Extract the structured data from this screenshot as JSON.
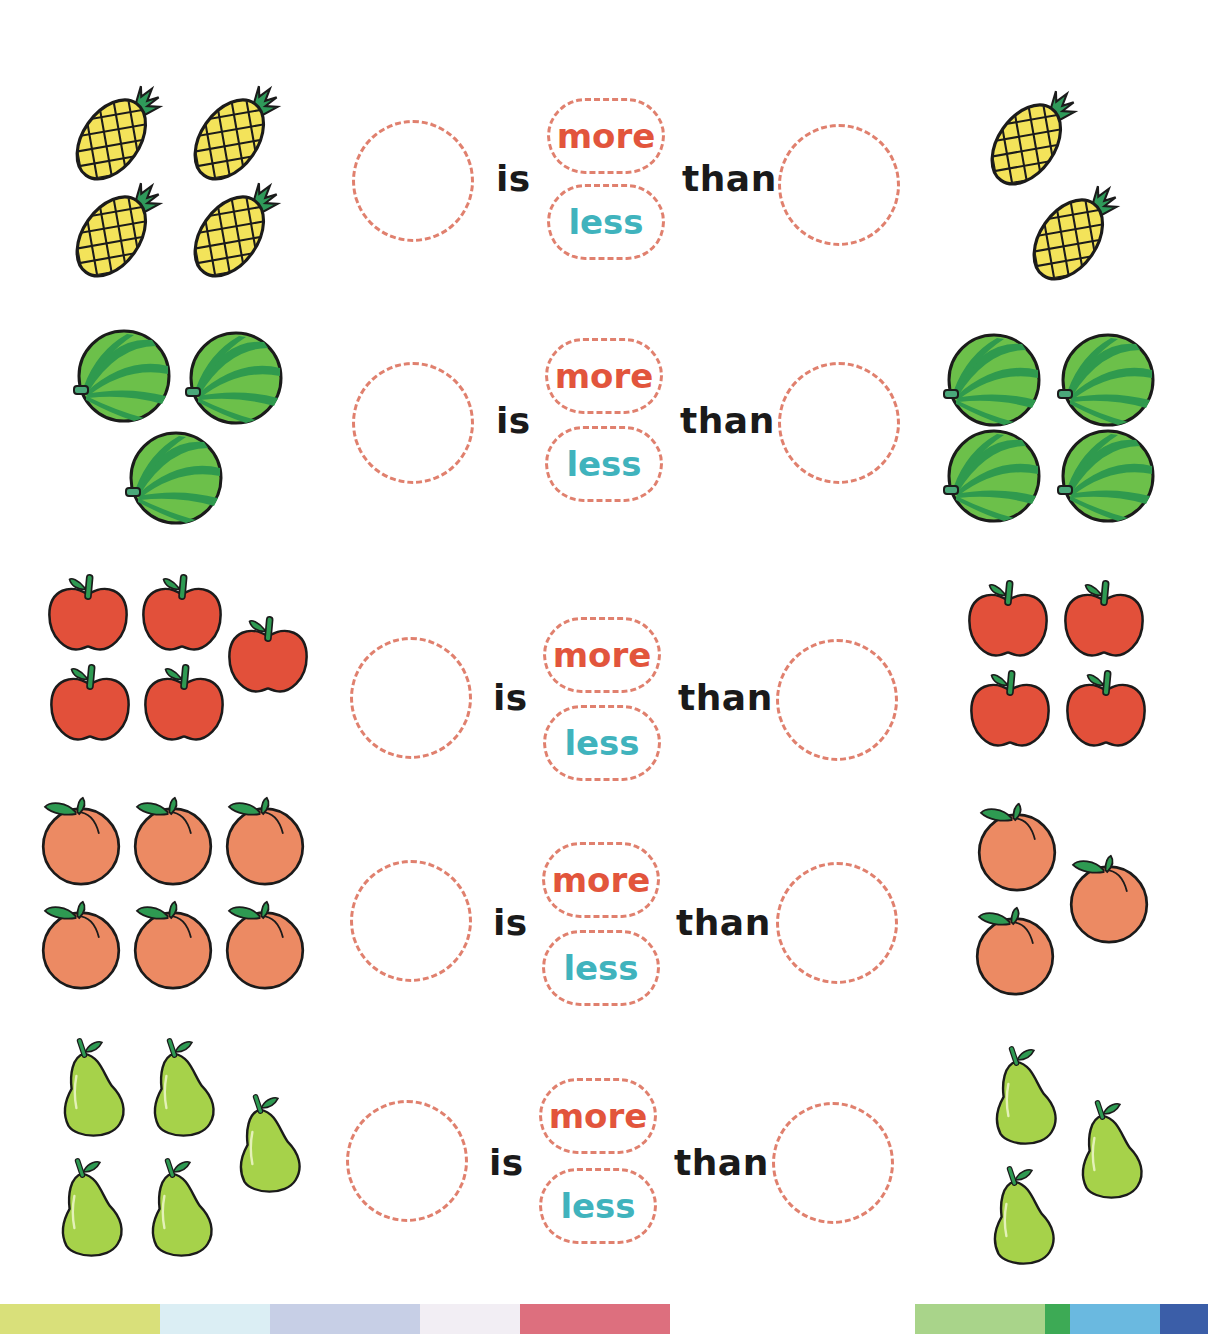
{
  "worksheet": {
    "rows": [
      {
        "fruit": "pineapple",
        "left_count": 4,
        "right_count": 2,
        "word_is": "is",
        "option_more": "more",
        "option_less": "less",
        "word_than": "than"
      },
      {
        "fruit": "watermelon",
        "left_count": 3,
        "right_count": 4,
        "word_is": "is",
        "option_more": "more",
        "option_less": "less",
        "word_than": "than"
      },
      {
        "fruit": "apple",
        "left_count": 5,
        "right_count": 4,
        "word_is": "is",
        "option_more": "more",
        "option_less": "less",
        "word_than": "than"
      },
      {
        "fruit": "peach",
        "left_count": 6,
        "right_count": 3,
        "word_is": "is",
        "option_more": "more",
        "option_less": "less",
        "word_than": "than"
      },
      {
        "fruit": "pear",
        "left_count": 5,
        "right_count": 3,
        "word_is": "is",
        "option_more": "more",
        "option_less": "less",
        "word_than": "than"
      }
    ]
  },
  "colors": {
    "dashed_border": "#e0806e",
    "more_text": "#e2553c",
    "less_text": "#40b3bd",
    "body_text": "#1a1a1a",
    "pineapple": "#f3e35a",
    "pineapple_leaf": "#2f9a5a",
    "watermelon_light": "#6cc04a",
    "watermelon_dark": "#2f9a4e",
    "apple": "#e2503a",
    "peach": "#ec8a63",
    "pear": "#a6d24a",
    "leaf": "#2e9a52"
  },
  "footer_strip": [
    {
      "color": "#d9e07a",
      "x": 0,
      "w": 160
    },
    {
      "color": "#dbeef4",
      "x": 160,
      "w": 110
    },
    {
      "color": "#c7cfe6",
      "x": 270,
      "w": 150
    },
    {
      "color": "#f2eef4",
      "x": 420,
      "w": 100
    },
    {
      "color": "#dd6f7e",
      "x": 520,
      "w": 150
    },
    {
      "color": "#a9d48a",
      "x": 915,
      "w": 130
    },
    {
      "color": "#3daa55",
      "x": 1045,
      "w": 25
    },
    {
      "color": "#6ab9e0",
      "x": 1070,
      "w": 90
    },
    {
      "color": "#3b5ea8",
      "x": 1160,
      "w": 48
    }
  ]
}
